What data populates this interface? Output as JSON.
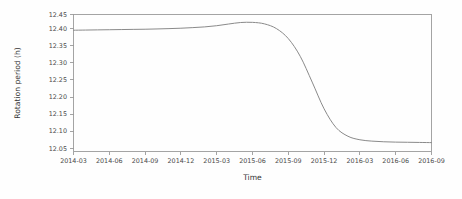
{
  "figure": {
    "background_color": "#fefefe",
    "frame_color": "#9a9a9a",
    "curve_color": "#8a8a8a"
  },
  "chart_data": {
    "type": "line",
    "title": "",
    "xlabel": "Time",
    "ylabel": "Rotation period (h)",
    "grid": false,
    "legend": null,
    "xlim": [
      "2014-03",
      "2016-09"
    ],
    "ylim": [
      12.05,
      12.45
    ],
    "ytick_labels": [
      "12.05",
      "12.10",
      "12.15",
      "12.20",
      "12.25",
      "12.30",
      "12.35",
      "12.40",
      "12.45"
    ],
    "ytick_values": [
      12.05,
      12.1,
      12.15,
      12.2,
      12.25,
      12.3,
      12.35,
      12.4,
      12.45
    ],
    "xtick_labels": [
      "2014-03",
      "2014-06",
      "2014-09",
      "2014-12",
      "2015-03",
      "2015-06",
      "2015-09",
      "2015-12",
      "2016-03",
      "2016-06",
      "2016-09"
    ],
    "series": [
      {
        "name": "Rotation period",
        "x": [
          "2014-03",
          "2014-04",
          "2014-05",
          "2014-06",
          "2014-07",
          "2014-08",
          "2014-09",
          "2014-10",
          "2014-11",
          "2014-12",
          "2015-01",
          "2015-02",
          "2015-03",
          "2015-04",
          "2015-05",
          "2015-06",
          "2015-07",
          "2015-08",
          "2015-09",
          "2015-10",
          "2015-11",
          "2015-12",
          "2016-01",
          "2016-02",
          "2016-03",
          "2016-04",
          "2016-05",
          "2016-06",
          "2016-07",
          "2016-08",
          "2016-09"
        ],
        "values": [
          12.403,
          12.4035,
          12.404,
          12.4045,
          12.405,
          12.4055,
          12.406,
          12.4068,
          12.4078,
          12.409,
          12.4108,
          12.413,
          12.4165,
          12.4215,
          12.426,
          12.4265,
          12.422,
          12.408,
          12.378,
          12.325,
          12.248,
          12.168,
          12.112,
          12.086,
          12.0755,
          12.0715,
          12.0695,
          12.0685,
          12.068,
          12.0675,
          12.067
        ]
      }
    ]
  }
}
